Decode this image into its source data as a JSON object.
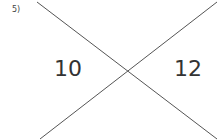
{
  "problem": {
    "label": "5)",
    "angles": {
      "left": "10",
      "right": "12"
    }
  },
  "lines": [
    {
      "x1": 37,
      "y1": 2,
      "x2": 217,
      "y2": 139
    },
    {
      "x1": 40,
      "y1": 139,
      "x2": 217,
      "y2": 2
    }
  ],
  "colors": {
    "line": "#555555"
  }
}
